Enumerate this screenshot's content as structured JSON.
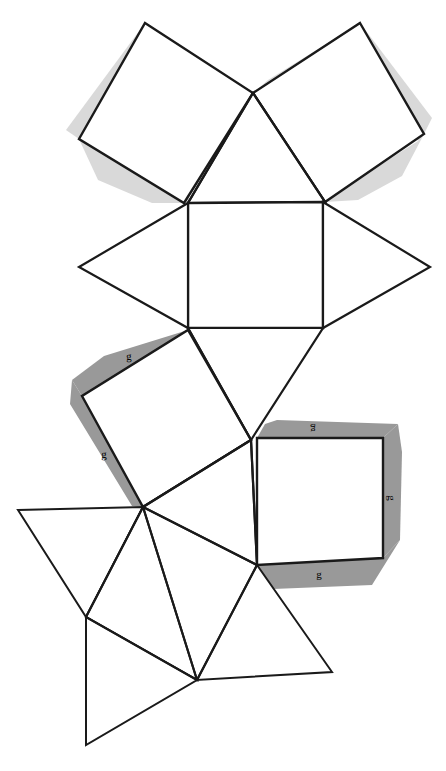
{
  "figure": {
    "name": "polyhedron-net",
    "width": 446,
    "height": 771,
    "background_color": "#ffffff",
    "stroke_color": "#000000",
    "face_fill_color": "#ffffff",
    "shade_light_color": "#d9d9d9",
    "shade_dark_color": "#999999",
    "stroke_width_main": 2.2,
    "stroke_width_thin": 1.6
  },
  "labels": {
    "edge_label_text": "g",
    "items": [
      {
        "id": "g-left-square-top",
        "text": "g",
        "x": 129,
        "y": 356,
        "rotate": -2
      },
      {
        "id": "g-left-square-side",
        "text": "g",
        "x": 104,
        "y": 454,
        "rotate": -1
      },
      {
        "id": "g-right-square-top",
        "text": "g",
        "x": 313,
        "y": 432,
        "rotate": 180
      },
      {
        "id": "g-right-square-right",
        "text": "g",
        "x": 390,
        "y": 500,
        "rotate": 90
      },
      {
        "id": "g-right-square-bottom",
        "text": "g",
        "x": 318,
        "y": 576,
        "rotate": 0
      }
    ]
  },
  "faces": {
    "squares": [
      {
        "id": "square-top-left",
        "kind": "square",
        "shaded": true,
        "shade": "light",
        "points": "145,23 253,93 184,203 79,139"
      },
      {
        "id": "square-top-right",
        "kind": "square",
        "shaded": true,
        "shade": "light",
        "points": "360,23 424,134 325,202 253,93"
      },
      {
        "id": "square-center",
        "kind": "square",
        "shaded": false,
        "shade": "none",
        "points": "188,203 323,202 323,328 188,328"
      },
      {
        "id": "square-lower-left",
        "kind": "square",
        "shaded": true,
        "shade": "dark",
        "points": "188,330 251,440 143,507 82,396"
      },
      {
        "id": "square-lower-right",
        "kind": "square",
        "shaded": true,
        "shade": "dark",
        "points": "257,438 383,438 383,558 257,565"
      }
    ],
    "triangles": [
      {
        "id": "triangle-top-center",
        "points": "253,93 325,202 188,203"
      },
      {
        "id": "triangle-left-mid",
        "points": "188,203 188,328 79,267"
      },
      {
        "id": "triangle-right-mid",
        "points": "323,202 430,267 323,328"
      },
      {
        "id": "triangle-upper-lower-mid",
        "points": "188,328 251,440 323,328"
      },
      {
        "id": "triangle-center-lower",
        "points": "251,440 257,565 143,507"
      },
      {
        "id": "triangle-bottom-left-a",
        "points": "18,510 143,507 86,617"
      },
      {
        "id": "triangle-bottom-left-b",
        "points": "143,507 197,680 86,617"
      },
      {
        "id": "triangle-bottom-left-c",
        "points": "86,617 197,680 86,745"
      },
      {
        "id": "triangle-bottom-right",
        "points": "257,565 332,672 197,680"
      }
    ]
  },
  "shading_bands": {
    "light": [
      {
        "id": "band-tl-top",
        "points": "145,23 253,93 243,101 223,82 150,33"
      },
      {
        "id": "band-tl-upper-left",
        "points": "145,23 150,33 91,141 79,139 68,132"
      },
      {
        "id": "band-tl-bottom",
        "points": "79,139 91,141 186,196 184,203 96,177"
      },
      {
        "id": "band-tr-top",
        "points": "360,23 353,33 270,90 253,93 263,82"
      },
      {
        "id": "band-tr-right",
        "points": "360,23 353,33 419,139 424,134 428,122"
      },
      {
        "id": "band-tr-bottom",
        "points": "424,134 419,139 330,196 325,202 350,198"
      }
    ],
    "dark": [
      {
        "id": "band-ll-top",
        "points": "188,330 182,340 90,394 82,396 74,384"
      },
      {
        "id": "band-ll-left",
        "points": "82,396 74,384 135,502 143,507 150,498"
      }
    ]
  },
  "shading_bands_octagonal": {
    "right_square": [
      {
        "id": "band-rs-top",
        "points": "257,438 383,438 395,426 272,424"
      },
      {
        "id": "band-rs-right",
        "points": "383,438 383,558 398,546 398,450"
      },
      {
        "id": "band-rs-bottom",
        "points": "257,565 383,558 371,584 276,588"
      }
    ]
  },
  "edges": {
    "description": "net fold and outline edges",
    "segments": [
      "145,23 253,93",
      "253,93 184,203",
      "184,203 79,139",
      "79,139 145,23",
      "360,23 424,134",
      "424,134 325,202",
      "325,202 253,93",
      "253,93 360,23",
      "188,203 323,202",
      "323,202 323,328",
      "323,328 188,328",
      "188,328 188,203",
      "188,203 79,267",
      "79,267 188,328",
      "323,202 430,267",
      "430,267 323,328",
      "188,328 251,440",
      "251,440 323,328",
      "188,330 82,396",
      "82,396 143,507",
      "143,507 251,440",
      "251,440 188,330",
      "257,438 383,438",
      "383,438 383,558",
      "383,558 257,565",
      "257,565 257,438",
      "251,440 257,565",
      "143,507 257,565",
      "18,510 143,507",
      "18,510 86,617",
      "86,617 143,507",
      "86,617 197,680",
      "197,680 143,507",
      "86,617 86,745",
      "86,745 197,680",
      "257,565 332,672",
      "332,672 197,680",
      "197,680 257,565"
    ]
  }
}
